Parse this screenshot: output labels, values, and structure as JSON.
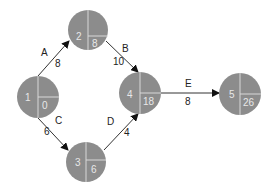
{
  "diagram": {
    "type": "activity-on-arrow network",
    "node_color": "#8c8c8c",
    "divider_color": "#d8d8d8",
    "edge_color": "#333333",
    "nodes": [
      {
        "id": "1",
        "label": "1",
        "value": "0",
        "cx": 38,
        "cy": 97,
        "r": 21
      },
      {
        "id": "2",
        "label": "2",
        "value": "8",
        "cx": 88,
        "cy": 30,
        "r": 20
      },
      {
        "id": "3",
        "label": "3",
        "value": "6",
        "cx": 86,
        "cy": 162,
        "r": 20
      },
      {
        "id": "4",
        "label": "4",
        "value": "18",
        "cx": 140,
        "cy": 93,
        "r": 21
      },
      {
        "id": "5",
        "label": "5",
        "value": "26",
        "cx": 240,
        "cy": 94,
        "r": 21
      }
    ],
    "edges": [
      {
        "id": "A",
        "from": "1",
        "to": "2",
        "activity": "A",
        "duration": "8"
      },
      {
        "id": "B",
        "from": "2",
        "to": "4",
        "activity": "B",
        "duration": "10"
      },
      {
        "id": "C",
        "from": "1",
        "to": "3",
        "activity": "C",
        "duration": "6"
      },
      {
        "id": "D",
        "from": "3",
        "to": "4",
        "activity": "D",
        "duration": "4"
      },
      {
        "id": "E",
        "from": "4",
        "to": "5",
        "activity": "E",
        "duration": "8"
      }
    ]
  }
}
